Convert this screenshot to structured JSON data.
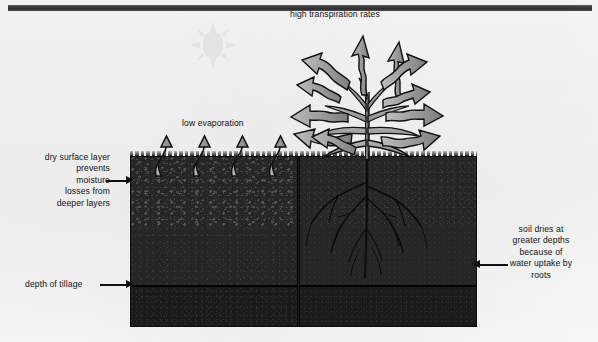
{
  "figure": {
    "title_arrow_label": "high transpiration rates",
    "evaporation_label": "low evaporation",
    "sun_icon": "sun-icon",
    "plant_icon": "plant-icon",
    "root_icon": "root-system-icon"
  },
  "labels": {
    "left_top": "dry surface layer\nprevents\nmoisture\nlosses from\ndeeper layers",
    "left_bottom": "depth of tillage",
    "right": "soil dries at\ngreater depths\nbecause of\nwater uptake by\nroots"
  },
  "colors": {
    "background": "#f4f4f4",
    "soil_dark": "#262626",
    "soil_deep": "#1b1b1b",
    "arrow_fill": "#9a9a9a",
    "arrow_outline": "#111111",
    "text": "#111111",
    "sun": "#e2e2e2",
    "top_bar": "#2c2c2c"
  }
}
